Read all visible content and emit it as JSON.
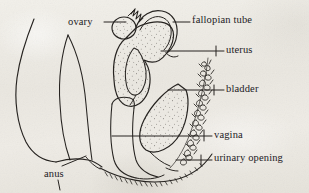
{
  "figure": {
    "medium": "hand-drawn ink line diagram on aged paper",
    "background_color": "#eceae4",
    "ink_color": "#22201e",
    "width": 309,
    "height": 193
  },
  "labels": [
    {
      "id": "ovary",
      "text": "ovary",
      "x": 68,
      "y": 17,
      "align": "left"
    },
    {
      "id": "fallopian-tube",
      "text": "fallopian tube",
      "x": 192,
      "y": 15,
      "align": "left"
    },
    {
      "id": "uterus",
      "text": "uterus",
      "x": 226,
      "y": 45,
      "align": "left"
    },
    {
      "id": "bladder",
      "text": "bladder",
      "x": 226,
      "y": 84,
      "align": "left"
    },
    {
      "id": "vagina",
      "text": "vagina",
      "x": 214,
      "y": 131,
      "align": "left"
    },
    {
      "id": "urinary-opening",
      "text": "urinary opening",
      "x": 214,
      "y": 154,
      "align": "left"
    },
    {
      "id": "anus",
      "text": "anus",
      "x": 44,
      "y": 170,
      "align": "left"
    }
  ],
  "structures": [
    {
      "id": "ovary",
      "name": "ovary",
      "shading": "stippled"
    },
    {
      "id": "fallopian-tube",
      "name": "fallopian tube",
      "shading": "outline"
    },
    {
      "id": "uterus",
      "name": "uterus",
      "shading": "stippled"
    },
    {
      "id": "bladder",
      "name": "bladder",
      "shading": "stippled"
    },
    {
      "id": "vagina",
      "name": "vagina",
      "shading": "outline"
    },
    {
      "id": "urinary-opening",
      "name": "urinary opening",
      "shading": "outline"
    },
    {
      "id": "anus",
      "name": "anus",
      "shading": "outline"
    },
    {
      "id": "rectum",
      "name": "rectum",
      "shading": "outline"
    },
    {
      "id": "pubic-hair",
      "name": "pubic hair",
      "shading": "scribble-texture"
    },
    {
      "id": "perineum",
      "name": "perineum",
      "shading": "hatched"
    },
    {
      "id": "abdominal-wall",
      "name": "abdominal wall",
      "shading": "outline"
    }
  ],
  "leader_lines": [
    {
      "id": "ovary-leader",
      "from": [
        104,
        22
      ],
      "to": [
        126,
        22
      ]
    },
    {
      "id": "fallopian-tube-leader",
      "from": [
        172,
        22
      ],
      "to": [
        190,
        22
      ]
    },
    {
      "id": "uterus-leader",
      "from": [
        161,
        51
      ],
      "to": [
        224,
        51
      ]
    },
    {
      "id": "bladder-leader",
      "from": [
        168,
        90
      ],
      "to": [
        224,
        90
      ]
    },
    {
      "id": "vagina-leader",
      "from": [
        112,
        136
      ],
      "to": [
        212,
        136
      ]
    },
    {
      "id": "urinary-opening-leader",
      "from": [
        178,
        160
      ],
      "to": [
        212,
        160
      ]
    },
    {
      "id": "anus-leader",
      "from": [
        62,
        167
      ],
      "to": [
        86,
        157
      ]
    },
    {
      "id": "anus-tick",
      "from": [
        58,
        180
      ],
      "to": [
        60,
        190
      ]
    }
  ]
}
